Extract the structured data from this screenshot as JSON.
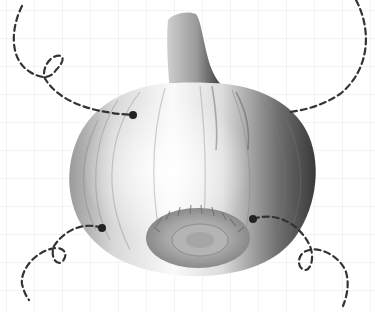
{
  "figure": {
    "background": "faint grid",
    "colors": {
      "background": "#ffffff",
      "grid": "#eeeeee",
      "callout_line": "#333333",
      "callout_dot": "#222222"
    }
  },
  "callouts": [
    {
      "id": "top-left",
      "anchor": [
        133,
        115
      ],
      "line_end": [
        22,
        6
      ],
      "has_loop": true
    },
    {
      "id": "top-right",
      "anchor": [
        290,
        112
      ],
      "line_end": [
        356,
        0
      ],
      "has_loop": false
    },
    {
      "id": "bottom-left",
      "anchor": [
        102,
        228
      ],
      "line_end": [
        29,
        300
      ],
      "has_loop": true
    },
    {
      "id": "bottom-right",
      "anchor": [
        253,
        219
      ],
      "line_end": [
        343,
        306
      ],
      "has_loop": true
    }
  ]
}
